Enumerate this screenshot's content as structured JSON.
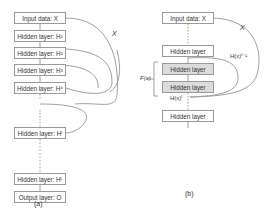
{
  "panel_a": {
    "caption": "(a)",
    "input": "Input data: X",
    "layers": [
      "Hidden layer: H¹",
      "Hidden layer: H²",
      "Hidden layer: H³",
      "Hidden layer: H⁴",
      "Hidden layer: Hˡ",
      "Hidden layer: Hᴸ"
    ],
    "output": "Output layer: O",
    "skip_label": "X"
  },
  "panel_b": {
    "caption": "(b)",
    "input": "Input data: X",
    "layers": [
      "Hidden layer",
      "Hidden layer",
      "Hidden layer",
      "Hidden layer"
    ],
    "skip_label": "X",
    "prev_label": "H(x)ˡ⁻¹",
    "out_label": "H(x)ˡ",
    "brace_label": "F(x)"
  },
  "colors": {
    "line": "#a0a0a0",
    "box_border": "#9a9a9a",
    "shaded": "#dcdcdc"
  }
}
